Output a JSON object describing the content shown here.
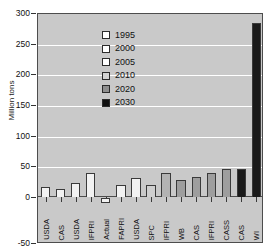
{
  "chart_data": {
    "type": "bar",
    "title": "",
    "xlabel": "",
    "ylabel": "Million tons",
    "ylim": [
      -50,
      300
    ],
    "yticks": [
      300,
      250,
      200,
      150,
      100,
      50,
      0,
      -50
    ],
    "grid": true,
    "legend_position": "top-left",
    "categories": [
      "USDA",
      "CAS",
      "USDA",
      "IFPRI",
      "Actual",
      "FAPRI",
      "USDA",
      "SPC",
      "IFPRI",
      "WB",
      "CAS",
      "IFPRI",
      "CASS",
      "CAS",
      "WI"
    ],
    "values": [
      18,
      15,
      24,
      40,
      -5,
      22,
      33,
      22,
      41,
      30,
      34,
      41,
      48,
      48,
      285
    ],
    "bar_colors": [
      "#f2f2f2",
      "#f2f2f2",
      "#f2f2f2",
      "#f2f2f2",
      "#f2f2f2",
      "#f2f2f2",
      "#f2f2f2",
      "#cfcfcf",
      "#b3b3b3",
      "#9e9e9e",
      "#9e9e9e",
      "#9e9e9e",
      "#9e9e9e",
      "#1a1a1a",
      "#1a1a1a"
    ],
    "legend": [
      {
        "label": "1995",
        "color": "#ffffff"
      },
      {
        "label": "2000",
        "color": "#ffffff"
      },
      {
        "label": "2005",
        "color": "#ffffff"
      },
      {
        "label": "2010",
        "color": "#d4d4d4"
      },
      {
        "label": "2020",
        "color": "#8f8f8f"
      },
      {
        "label": "2030",
        "color": "#111111"
      }
    ]
  },
  "style": {
    "plot_background": "#c9c9c9",
    "gridline_color": "#ffffff",
    "axis_color": "#4d4d4d",
    "page_background": "#ffffff"
  }
}
